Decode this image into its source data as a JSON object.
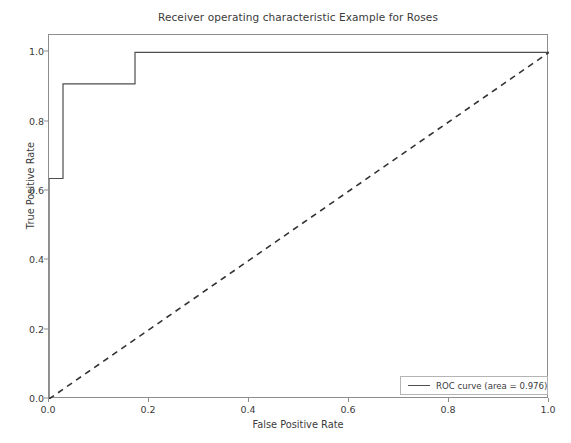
{
  "chart_data": {
    "type": "line",
    "title": "Receiver operating characteristic Example for Roses",
    "xlabel": "False Positive Rate",
    "ylabel": "True Positive Rate",
    "xlim": [
      0.0,
      1.0
    ],
    "ylim": [
      0.0,
      1.05
    ],
    "grid": false,
    "legend_position": "lower right",
    "xticks": [
      "0.0",
      "0.2",
      "0.4",
      "0.6",
      "0.8",
      "1.0"
    ],
    "xtick_values": [
      0.0,
      0.2,
      0.4,
      0.6,
      0.8,
      1.0
    ],
    "yticks": [
      "0.0",
      "0.2",
      "0.4",
      "0.6",
      "0.8",
      "1.0"
    ],
    "ytick_values": [
      0.0,
      0.2,
      0.4,
      0.6,
      0.8,
      1.0
    ],
    "series": [
      {
        "name": "ROC curve (area = 0.976)",
        "style": "step",
        "linestyle": "solid",
        "color": "#4d4d4d",
        "x": [
          0.0,
          0.0,
          0.028,
          0.028,
          0.172,
          0.172,
          1.0
        ],
        "y": [
          0.0,
          0.636,
          0.636,
          0.909,
          0.909,
          1.0,
          1.0
        ]
      },
      {
        "name": "chance-diagonal",
        "style": "line",
        "linestyle": "dashed",
        "color": "#333333",
        "x": [
          0.0,
          1.0
        ],
        "y": [
          0.0,
          1.0
        ]
      }
    ],
    "annotations": {
      "auc_value": "0.976"
    }
  },
  "legend": {
    "roc_label": "ROC curve (area = 0.976)"
  }
}
